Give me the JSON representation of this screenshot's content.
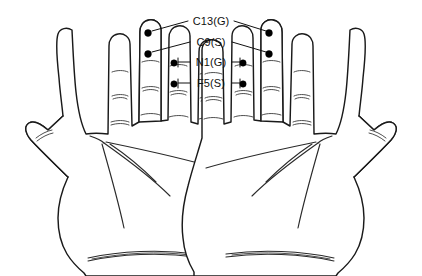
{
  "figure": {
    "background_color": "#ffffff",
    "line_color": "#1a1a1a",
    "marker_color": "#000000",
    "width": 422,
    "height": 276
  },
  "labels": [
    {
      "id": "c13g",
      "text": "C13(G)",
      "x": 211,
      "y": 16,
      "icon": "leader-line-icon"
    },
    {
      "id": "c9s",
      "text": "C9(S)",
      "x": 211,
      "y": 37,
      "icon": "leader-line-icon"
    },
    {
      "id": "n1g",
      "text": "N1(G)",
      "x": 211,
      "y": 57,
      "icon": "leader-line-icon"
    },
    {
      "id": "f5s",
      "text": "F5(S)",
      "x": 211,
      "y": 78,
      "icon": "leader-line-icon"
    }
  ],
  "acupoints": [
    {
      "id": "c13g-left",
      "label": "C13(G)",
      "hand": "left",
      "finger": "index",
      "cx": 148,
      "cy": 33,
      "r": 3.4
    },
    {
      "id": "c13g-right",
      "label": "C13(G)",
      "hand": "right",
      "finger": "index",
      "cx": 269,
      "cy": 33,
      "r": 3.4
    },
    {
      "id": "c9s-left",
      "label": "C9(S)",
      "hand": "left",
      "finger": "index",
      "cx": 148,
      "cy": 54,
      "r": 3.4
    },
    {
      "id": "c9s-right",
      "label": "C9(S)",
      "hand": "right",
      "finger": "index",
      "cx": 269,
      "cy": 54,
      "r": 3.4
    },
    {
      "id": "n1g-left",
      "label": "N1(G)",
      "hand": "left",
      "finger": "ring",
      "cx": 174,
      "cy": 63,
      "r": 3.2
    },
    {
      "id": "n1g-right",
      "label": "N1(G)",
      "hand": "right",
      "finger": "ring",
      "cx": 243,
      "cy": 63,
      "r": 3.2
    },
    {
      "id": "f5s-left",
      "label": "F5(S)",
      "hand": "left",
      "finger": "ring",
      "cx": 174,
      "cy": 84,
      "r": 3.2
    },
    {
      "id": "f5s-right",
      "label": "F5(S)",
      "hand": "right",
      "finger": "ring",
      "cx": 243,
      "cy": 84,
      "r": 3.2
    }
  ],
  "hands": [
    {
      "id": "left-hand",
      "side": "left",
      "view": "palm",
      "thumb_side": "left"
    },
    {
      "id": "right-hand",
      "side": "right",
      "view": "palm",
      "thumb_side": "right"
    }
  ]
}
